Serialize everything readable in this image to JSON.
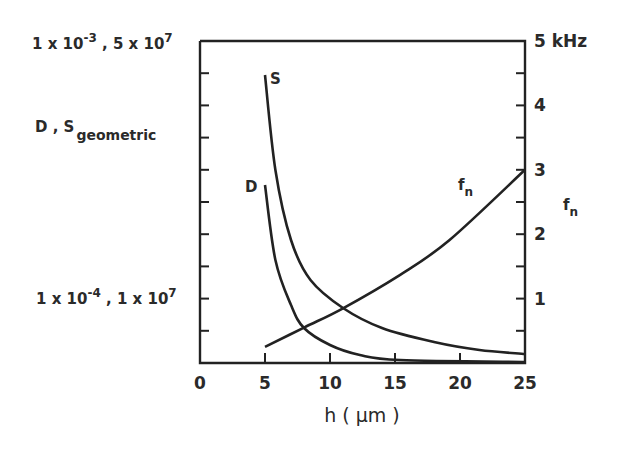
{
  "chart_data": {
    "type": "line",
    "title": "",
    "xlabel": "h (μm)",
    "x_ticks": [
      0,
      5,
      10,
      15,
      20,
      25
    ],
    "xlim": [
      0,
      25
    ],
    "left_axis": {
      "label_main": "D , S",
      "label_sub": "geometric",
      "top_label": "1 x 10^-3 , 5 x 10^7",
      "lower_label": "1 x 10^-4 , 1 x 10^7",
      "scale": "log"
    },
    "right_axis": {
      "label": "f_n",
      "unit": "kHz",
      "ticks": [
        "1",
        "2",
        "3",
        "4",
        "5 kHz"
      ],
      "ylim": [
        0,
        5
      ]
    },
    "series": [
      {
        "name": "S",
        "axis": "left",
        "label": "S",
        "x": [
          5,
          5.8,
          7,
          8.5,
          11,
          14,
          18,
          21.5,
          25
        ],
        "y_px": [
          75,
          170,
          240,
          280,
          308,
          328,
          342,
          350,
          354
        ]
      },
      {
        "name": "D",
        "axis": "left",
        "label": "D",
        "x": [
          5,
          5.8,
          7,
          8,
          10,
          12.3,
          15.4,
          25
        ],
        "y_px": [
          185,
          260,
          305,
          328,
          345,
          355,
          360,
          362
        ]
      },
      {
        "name": "f_n",
        "axis": "right",
        "label": "f",
        "label_sub": "n",
        "x": [
          5,
          8,
          11,
          15.4,
          19.2,
          25
        ],
        "y": [
          0.25,
          0.55,
          0.85,
          1.37,
          1.91,
          3.0
        ]
      }
    ],
    "grid": false,
    "legend": "inline labels"
  },
  "texts": {
    "left_top": "1 x 10",
    "left_top_exp": "-3",
    "left_top_b": " , 5 x 10",
    "left_top_exp2": "7",
    "left_mid_main": "D , S",
    "left_mid_sub": "geometric",
    "left_low": "1 x 10",
    "left_low_exp": "-4",
    "left_low_b": " , 1 x 10",
    "left_low_exp2": "7",
    "right_label": "f",
    "right_label_sub": "n",
    "xlabel": "h ( μm )",
    "curve_S": "S",
    "curve_D": "D",
    "curve_fn": "f",
    "curve_fn_sub": "n"
  }
}
